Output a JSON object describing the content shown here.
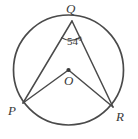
{
  "figure": {
    "type": "circle-geometry-diagram",
    "stroke_color": "#4a4a4a",
    "label_color": "#3a3a3a",
    "background_color": "#ffffff",
    "circle": {
      "center_x": 68.5,
      "center_y": 70.0,
      "radius": 55.0,
      "stroke_width": 1.6
    },
    "points": [
      {
        "name": "Q",
        "label": "Q",
        "x": 72.0,
        "y": 21.0,
        "on_circle": true,
        "dot": false
      },
      {
        "name": "P",
        "label": "P",
        "x": 23.0,
        "y": 103.0,
        "on_circle": true,
        "dot": false
      },
      {
        "name": "R",
        "label": "R",
        "x": 113.0,
        "y": 107.0,
        "on_circle": true,
        "dot": false
      },
      {
        "name": "O",
        "label": "O",
        "x": 68.5,
        "y": 70.0,
        "on_circle": false,
        "dot": true
      }
    ],
    "segments": [
      {
        "name": "QP",
        "from": "Q",
        "to": "P"
      },
      {
        "name": "QR",
        "from": "Q",
        "to": "R"
      },
      {
        "name": "OP",
        "from": "O",
        "to": "P"
      },
      {
        "name": "OR",
        "from": "O",
        "to": "R"
      }
    ],
    "angle_marks": [
      {
        "name": "angle-PQR",
        "vertex": "Q",
        "value": 54,
        "unit": "degrees",
        "label": "54°",
        "arc_radius": 18
      }
    ],
    "labels": {
      "Q": "Q",
      "P": "P",
      "R": "R",
      "O": "O",
      "angle": "54°"
    }
  }
}
